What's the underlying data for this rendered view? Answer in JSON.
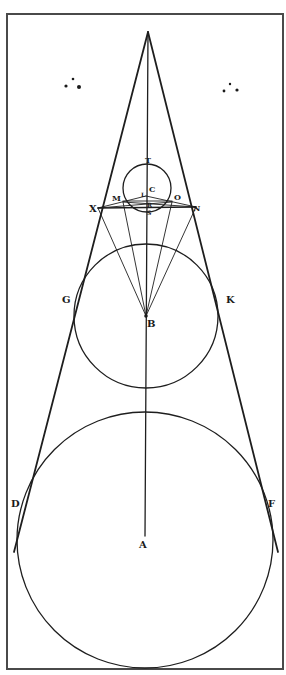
{
  "figure": {
    "type": "geometric-diagram",
    "ink_color": "#1e1e1e",
    "frame_color": "#4a4a4a",
    "background": "#ffffff"
  },
  "labels": {
    "T": "T",
    "C": "C",
    "L": "L",
    "R": "R",
    "S": "S",
    "M": "M",
    "O": "O",
    "X": "X",
    "N": "N",
    "G": "G",
    "K": "K",
    "B": "B",
    "D": "D",
    "F": "F",
    "A": "A"
  },
  "ornaments": {
    "left": "three-dot-cluster",
    "right": "three-dot-cluster"
  },
  "circles": [
    {
      "name": "small-circle",
      "center_label": "C"
    },
    {
      "name": "middle-circle",
      "center_label": "B",
      "tangent_points": [
        "G",
        "K"
      ]
    },
    {
      "name": "large-circle",
      "center_label": "A",
      "tangent_points": [
        "D",
        "F"
      ]
    }
  ]
}
